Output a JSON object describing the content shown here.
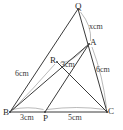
{
  "figure": {
    "kind": "geometry-diagram",
    "stroke_color": "#3a3a3a",
    "arc_color": "#8c8c8c",
    "background_color": "#ffffff"
  },
  "points": [
    {
      "id": "Q",
      "label": "Q",
      "x": 78,
      "y": 9,
      "label_x": 75,
      "label_y": 2
    },
    {
      "id": "A",
      "label": "A",
      "x": 89,
      "y": 44,
      "label_x": 90,
      "label_y": 38
    },
    {
      "id": "R",
      "label": "R",
      "x": 57,
      "y": 62,
      "label_x": 50,
      "label_y": 56
    },
    {
      "id": "B",
      "label": "B",
      "x": 10,
      "y": 112,
      "label_x": 3,
      "label_y": 108
    },
    {
      "id": "P",
      "label": "P",
      "x": 45,
      "y": 112,
      "label_x": 43,
      "label_y": 114
    },
    {
      "id": "C",
      "label": "C",
      "x": 107,
      "y": 112,
      "label_x": 108,
      "label_y": 107
    }
  ],
  "segments": [
    {
      "id": "QB",
      "from": "Q",
      "to": "B",
      "name": "segment-q-b"
    },
    {
      "id": "QC",
      "from": "Q",
      "to": "C",
      "name": "segment-q-c"
    },
    {
      "id": "BC",
      "from": "B",
      "to": "C",
      "name": "segment-b-c"
    },
    {
      "id": "BA",
      "from": "B",
      "to": "A",
      "name": "segment-b-a"
    },
    {
      "id": "RC",
      "from": "R",
      "to": "C",
      "name": "segment-r-c"
    },
    {
      "id": "AP",
      "from": "A",
      "to": "P",
      "name": "segment-a-p"
    }
  ],
  "measure_labels": [
    {
      "id": "qa",
      "text": "xcm",
      "x": 89,
      "y": 23,
      "name": "length-label-qa"
    },
    {
      "id": "ra",
      "text": "3cm",
      "x": 61,
      "y": 61,
      "name": "length-label-ra"
    },
    {
      "id": "br",
      "text": "6cm",
      "x": 15,
      "y": 70,
      "name": "length-label-br"
    },
    {
      "id": "ac",
      "text": "6cm",
      "x": 96,
      "y": 66,
      "name": "length-label-ac"
    },
    {
      "id": "bp",
      "text": "3cm",
      "x": 20,
      "y": 114,
      "name": "length-label-bp"
    },
    {
      "id": "pc",
      "text": "5cm",
      "x": 68,
      "y": 114,
      "name": "length-label-pc"
    }
  ],
  "arcs": [
    {
      "id": "arc-qa",
      "name": "measure-arc-qa",
      "d": "M 80.5 12 Q 92 26 90.5 41"
    },
    {
      "id": "arc-ac",
      "name": "measure-arc-ac",
      "d": "M 92 47 Q 103 76 106.5 108"
    },
    {
      "id": "arc-ra",
      "name": "measure-arc-ra",
      "d": "M 60 63 Q 74 62 86.5 46"
    },
    {
      "id": "arc-br",
      "name": "measure-arc-br",
      "d": "M 12.5 110 Q 33 89 55 64"
    },
    {
      "id": "arc-bp",
      "name": "measure-arc-bp",
      "d": "M 12 109.5 Q 28 106 43.5 109.5"
    },
    {
      "id": "arc-pc",
      "name": "measure-arc-pc",
      "d": "M 47 109.5 Q 77 105.5 105 109.5"
    }
  ]
}
